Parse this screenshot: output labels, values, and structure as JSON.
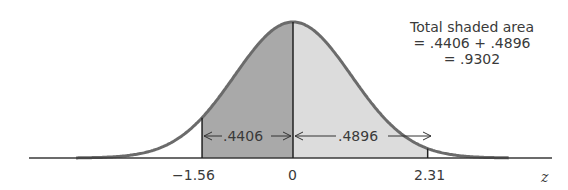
{
  "chart_data": {
    "type": "area",
    "xlabel": "z",
    "ylabel": "",
    "x_ticks": [
      "-1.56",
      "0",
      "2.31"
    ],
    "regions": [
      {
        "from": -1.56,
        "to": 0,
        "area": 0.4406,
        "label": ".4406",
        "shade": "dark"
      },
      {
        "from": 0,
        "to": 2.31,
        "area": 0.4896,
        "label": ".4896",
        "shade": "light"
      }
    ],
    "total_area": 0.9302,
    "annotation": [
      "Total shaded area",
      "= .4406 + .4896",
      "= .9302"
    ],
    "grid": false,
    "legend": "none"
  },
  "labels": {
    "tick_left": "−1.56",
    "tick_mid": "0",
    "tick_right": "2.31",
    "axis": "z",
    "area_left": ".4406",
    "area_right": ".4896",
    "note_line1": "Total shaded area",
    "note_line2": "= .4406 + .4896",
    "note_line3": "= .9302"
  },
  "colors": {
    "curve": "#6b6b6b",
    "dark_shade": "#a9a9a9",
    "light_shade": "#dcdcdc",
    "axis": "#3a3a3a",
    "text": "#3a3a3a"
  }
}
